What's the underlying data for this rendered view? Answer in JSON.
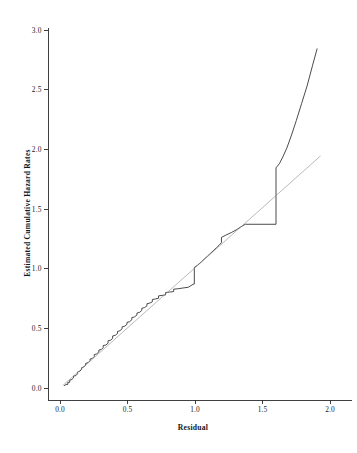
{
  "chart_data": {
    "type": "line",
    "title": "",
    "xlabel": "Residual",
    "ylabel": "Estimated Cumulative Hazard Rates",
    "xlim": [
      0.0,
      2.0
    ],
    "ylim": [
      0.0,
      3.0
    ],
    "grid": false,
    "legend": "none",
    "xticks": [
      "0.0",
      "0.5",
      "1.0",
      "1.5",
      "2.0"
    ],
    "xtick_values": [
      0.0,
      0.5,
      1.0,
      1.5,
      2.0
    ],
    "yticks": [
      "0.0",
      "0.5",
      "1.0",
      "1.5",
      "2.0",
      "2.5",
      "3.0"
    ],
    "ytick_values": [
      0.0,
      0.5,
      1.0,
      1.5,
      2.0,
      2.5,
      3.0
    ],
    "series": [
      {
        "name": "Estimated cumulative hazard (step function)",
        "type": "step",
        "color": "#2a2a2a",
        "points": [
          [
            0.03,
            0.018
          ],
          [
            0.045,
            0.03
          ],
          [
            0.058,
            0.03
          ],
          [
            0.058,
            0.048
          ],
          [
            0.072,
            0.048
          ],
          [
            0.072,
            0.065
          ],
          [
            0.088,
            0.072
          ],
          [
            0.1,
            0.085
          ],
          [
            0.1,
            0.1
          ],
          [
            0.118,
            0.104
          ],
          [
            0.13,
            0.12
          ],
          [
            0.13,
            0.134
          ],
          [
            0.146,
            0.14
          ],
          [
            0.16,
            0.156
          ],
          [
            0.16,
            0.17
          ],
          [
            0.176,
            0.176
          ],
          [
            0.19,
            0.192
          ],
          [
            0.19,
            0.206
          ],
          [
            0.208,
            0.212
          ],
          [
            0.222,
            0.228
          ],
          [
            0.222,
            0.242
          ],
          [
            0.24,
            0.248
          ],
          [
            0.254,
            0.264
          ],
          [
            0.254,
            0.28
          ],
          [
            0.272,
            0.286
          ],
          [
            0.288,
            0.302
          ],
          [
            0.288,
            0.318
          ],
          [
            0.306,
            0.322
          ],
          [
            0.32,
            0.338
          ],
          [
            0.32,
            0.356
          ],
          [
            0.34,
            0.36
          ],
          [
            0.356,
            0.376
          ],
          [
            0.356,
            0.396
          ],
          [
            0.374,
            0.4
          ],
          [
            0.39,
            0.416
          ],
          [
            0.39,
            0.436
          ],
          [
            0.41,
            0.442
          ],
          [
            0.426,
            0.456
          ],
          [
            0.426,
            0.474
          ],
          [
            0.444,
            0.48
          ],
          [
            0.46,
            0.496
          ],
          [
            0.46,
            0.512
          ],
          [
            0.48,
            0.518
          ],
          [
            0.496,
            0.534
          ],
          [
            0.496,
            0.55
          ],
          [
            0.516,
            0.556
          ],
          [
            0.532,
            0.572
          ],
          [
            0.532,
            0.59
          ],
          [
            0.552,
            0.596
          ],
          [
            0.57,
            0.612
          ],
          [
            0.57,
            0.628
          ],
          [
            0.59,
            0.634
          ],
          [
            0.606,
            0.65
          ],
          [
            0.606,
            0.668
          ],
          [
            0.626,
            0.674
          ],
          [
            0.644,
            0.688
          ],
          [
            0.644,
            0.706
          ],
          [
            0.666,
            0.712
          ],
          [
            0.684,
            0.722
          ],
          [
            0.684,
            0.742
          ],
          [
            0.708,
            0.746
          ],
          [
            0.73,
            0.752
          ],
          [
            0.73,
            0.772
          ],
          [
            0.756,
            0.776
          ],
          [
            0.782,
            0.78
          ],
          [
            0.782,
            0.8
          ],
          [
            0.812,
            0.804
          ],
          [
            0.842,
            0.808
          ],
          [
            0.842,
            0.828
          ],
          [
            0.876,
            0.832
          ],
          [
            0.91,
            0.838
          ],
          [
            0.95,
            0.844
          ],
          [
            0.985,
            0.868
          ],
          [
            0.985,
            0.87
          ],
          [
            0.995,
            0.872
          ],
          [
            0.995,
            1.01
          ],
          [
            1.02,
            1.03
          ],
          [
            1.048,
            1.058
          ],
          [
            1.07,
            1.082
          ],
          [
            1.092,
            1.104
          ],
          [
            1.112,
            1.126
          ],
          [
            1.135,
            1.15
          ],
          [
            1.16,
            1.176
          ],
          [
            1.178,
            1.196
          ],
          [
            1.196,
            1.218
          ],
          [
            1.196,
            1.262
          ],
          [
            1.23,
            1.282
          ],
          [
            1.268,
            1.302
          ],
          [
            1.305,
            1.325
          ],
          [
            1.34,
            1.35
          ],
          [
            1.372,
            1.372
          ],
          [
            1.6,
            1.372
          ],
          [
            1.6,
            1.845
          ],
          [
            1.625,
            1.88
          ],
          [
            1.65,
            1.935
          ],
          [
            1.68,
            2.01
          ],
          [
            1.715,
            2.12
          ],
          [
            1.75,
            2.24
          ],
          [
            1.79,
            2.385
          ],
          [
            1.83,
            2.53
          ],
          [
            1.87,
            2.7
          ],
          [
            1.905,
            2.845
          ]
        ]
      },
      {
        "name": "45-degree reference line",
        "type": "line",
        "color": "#8c8c8c",
        "points": [
          [
            0.02,
            0.02
          ],
          [
            1.93,
            1.945
          ]
        ]
      }
    ]
  },
  "axes": {
    "x_title": "Residual",
    "y_title": "Estimated Cumulative Hazard Rates"
  }
}
